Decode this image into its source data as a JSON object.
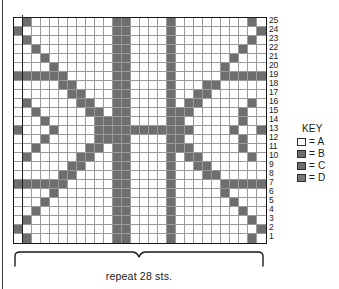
{
  "chart_data": {
    "type": "heatmap",
    "title": "",
    "xlabel": "repeat 28 sts.",
    "ylabel": "",
    "columns": 28,
    "rows": 25,
    "row_labels": [
      "25",
      "24",
      "23",
      "22",
      "21",
      "20",
      "19",
      "18",
      "17",
      "16",
      "15",
      "14",
      "13",
      "12",
      "11",
      "10",
      "9",
      "8",
      "7",
      "6",
      "5",
      "4",
      "3",
      "2",
      "1"
    ],
    "palette": {
      "A": "#ffffff",
      "B": "#6e6e6e",
      "C": "#6e6e6e",
      "D": "#7a7a7a"
    },
    "legend_position": "right",
    "grid": true,
    "cells": [
      "ABAAAAAAAAABBAAAABAAAAAAAABA",
      "BAAAAAAAAAABBAAAABAAAAAAAAAB",
      "ABAAAAAAAAABBAAAABAAAAAAAABA",
      "AABAAAAAAAABBAAAABAAAAAAABAA",
      "AAABAAAAAAABBAAAABAAAAAABAAA",
      "AAAABAAAAAABBAAAABAAAAABAAAA",
      "BBBBBBAAAAABBAAAABAAAAABBBBB",
      "AAAAABBAAAABBAAAABAAABBAAAAA",
      "AAAAAABBAAABBAAAABAABBAAAAAA",
      "ABAAAAABBAABBAAAABABBAAAAABA",
      "AABAAAAABBABBAAAABBBAAAAABAA",
      "AAABAAAAABBBBAAAABBAAAAAABAA",
      "BAAABAAAABBBBBBBBBBBAAAABAAB",
      "AAABAAAAABBBBAAAABBAAAAAABAA",
      "AABAAAAABBABBAAAABBBAAAAABAA",
      "ABAAAAABBAABBAAAABABBAAAAABA",
      "AAAAAABBAAABBAAAABAABBAAAAAA",
      "AAAAABBAAAABBAAAABAAABBAAAAA",
      "BBBBBBAAAAABBAAAABAAAAABBBBB",
      "AAAABAAAAAABBAAAABAAAAABAAAA",
      "AAABAAAAAAABBAAAABAAAAAABAAA",
      "AABAAAAAAAABBAAAABAAAAAAABAA",
      "ABAAAAAAAAABBAAAABAAAAAAAABA",
      "BAAAAAAAAAABBAAAABAAAAAAAAAB",
      "ABAAAAAAAAABBAAAABAAAAAAAABA"
    ]
  },
  "key": {
    "title": "KEY",
    "entries": [
      {
        "symbol": "A",
        "label": "= A",
        "color": "#ffffff",
        "swatch_name": "key-swatch-a"
      },
      {
        "symbol": "B",
        "label": "= B",
        "color": "#6e6e6e",
        "swatch_name": "key-swatch-b"
      },
      {
        "symbol": "C",
        "label": "= C",
        "color": "#6e6e6e",
        "swatch_name": "key-swatch-c"
      },
      {
        "symbol": "D",
        "label": "= D",
        "color": "#7a7a7a",
        "swatch_name": "key-swatch-d"
      }
    ]
  },
  "caption": {
    "repeat_text": "repeat 28 sts."
  }
}
